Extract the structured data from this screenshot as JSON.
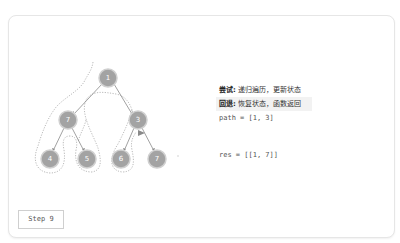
{
  "tree": {
    "nodes": [
      {
        "id": "n1",
        "label": "1",
        "x": 108,
        "y": 78
      },
      {
        "id": "n2",
        "label": "7",
        "x": 68,
        "y": 120
      },
      {
        "id": "n3",
        "label": "3",
        "x": 138,
        "y": 120
      },
      {
        "id": "n4",
        "label": "4",
        "x": 50,
        "y": 159
      },
      {
        "id": "n5",
        "label": "5",
        "x": 87,
        "y": 159
      },
      {
        "id": "n6",
        "label": "6",
        "x": 121,
        "y": 159
      },
      {
        "id": "n7",
        "label": "7",
        "x": 157,
        "y": 159
      }
    ],
    "node_color": "#9e9e9e",
    "edge_color": "#8a8a8a",
    "trace_color": "#a8a8a8"
  },
  "info": {
    "try_label": "尝试:",
    "try_text": " 递归遍历，更新状态",
    "back_label": "回退:",
    "back_text": " 恢复状态，函数返回",
    "path": "path = [1, 3]",
    "res": "res = [[1, 7]]"
  },
  "step": {
    "label": "Step 9"
  }
}
